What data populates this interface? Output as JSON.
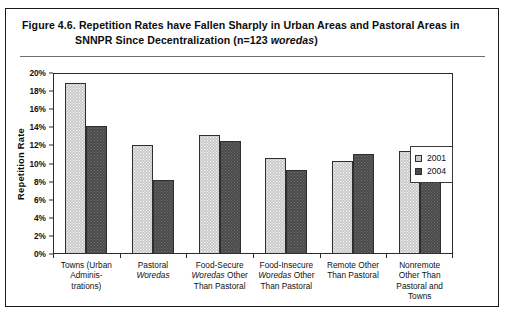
{
  "figure": {
    "caption_line_1": "Figure 4.6.   Repetition Rates have Fallen Sharply in Urban Areas and Pastoral Areas in",
    "caption_line_2_prefix": "SNNPR Since Decentralization (n=123 ",
    "caption_line_2_italic": "woredas",
    "caption_line_2_suffix": ")"
  },
  "legend": {
    "items": [
      {
        "label": "2001",
        "color": "#c9c9c9"
      },
      {
        "label": "2004",
        "color": "#4a4a4a"
      }
    ]
  },
  "chart_data": {
    "type": "bar",
    "title": "Figure 4.6. Repetition Rates have Fallen Sharply in Urban Areas and Pastoral Areas in SNNPR Since Decentralization (n=123 woredas)",
    "xlabel": "",
    "ylabel": "Repetition Rate",
    "ylim": [
      0,
      20
    ],
    "ytick_values": [
      0,
      2,
      4,
      6,
      8,
      10,
      12,
      14,
      16,
      18,
      20
    ],
    "ytick_labels": [
      "0%",
      "2%",
      "4%",
      "6%",
      "8%",
      "10%",
      "12%",
      "14%",
      "16%",
      "18%",
      "20%"
    ],
    "grid": false,
    "legend_position": "right-inside",
    "categories": [
      "Towns (Urban Adminis-trations)",
      "Pastoral Woredas",
      "Food-Secure Woredas Other Than Pastoral",
      "Food-Insecure Woredas Other Than Pastoral",
      "Remote Other Than Pastoral",
      "Nonremote Other Than Pastoral and Towns"
    ],
    "category_lines": [
      [
        "Towns (Urban",
        "Adminis-",
        "trations)"
      ],
      [
        "Pastoral",
        "Woredas"
      ],
      [
        "Food-Secure",
        "Woredas Other",
        "Than Pastoral"
      ],
      [
        "Food-Insecure",
        "Woredas Other",
        "Than Pastoral"
      ],
      [
        "Remote Other",
        "Than Pastoral"
      ],
      [
        "Nonremote",
        "Other Than",
        "Pastoral and",
        "Towns"
      ]
    ],
    "series": [
      {
        "name": "2001",
        "color": "#c9c9c9",
        "values": [
          18.9,
          12.0,
          13.1,
          10.6,
          10.3,
          11.4
        ]
      },
      {
        "name": "2004",
        "color": "#4a4a4a",
        "values": [
          14.2,
          8.2,
          12.5,
          9.3,
          11.1,
          10.1
        ]
      }
    ]
  }
}
